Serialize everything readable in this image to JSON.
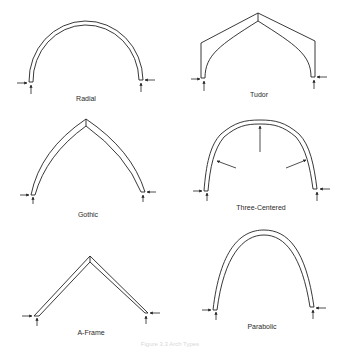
{
  "diagram": {
    "title": "Arch types",
    "caption": "Figure 3.3  Arch Types",
    "panels": [
      {
        "id": "radial",
        "label": "Radial"
      },
      {
        "id": "tudor",
        "label": "Tudor"
      },
      {
        "id": "gothic",
        "label": "Gothic"
      },
      {
        "id": "three-centered",
        "label": "Three-Centered"
      },
      {
        "id": "a-frame",
        "label": "A-Frame"
      },
      {
        "id": "parabolic",
        "label": "Parabolic"
      }
    ],
    "colors": {
      "line": "#222222",
      "background": "#ffffff"
    }
  }
}
